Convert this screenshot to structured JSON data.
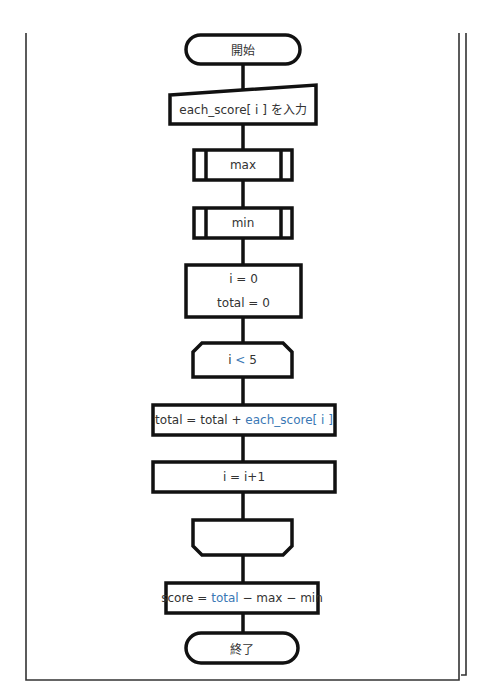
{
  "flowchart": {
    "start": {
      "label": "開始"
    },
    "input": {
      "label": "each_score[ i ] を入力"
    },
    "sub_max": {
      "label": "max"
    },
    "sub_min": {
      "label": "min"
    },
    "init": {
      "line1": "i = 0",
      "line2": "total = 0"
    },
    "loop_start": {
      "pre": "i ",
      "op": "<",
      "post": " 5"
    },
    "accumulate": {
      "pre": "total = total + ",
      "highlight": "each_score[ i ]"
    },
    "increment": {
      "label": "i = i+1"
    },
    "loop_end": {
      "label": ""
    },
    "score": {
      "pre": "score = ",
      "highlight": "total",
      "post": " − max − min"
    },
    "end": {
      "label": "終了"
    }
  },
  "colors": {
    "stroke": "#111111",
    "highlight": "#3a78b5",
    "frame": "#333333"
  }
}
